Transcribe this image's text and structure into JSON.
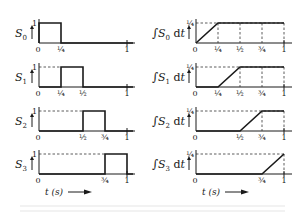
{
  "figure": {
    "left_column": {
      "panels": [
        {
          "label": "S",
          "sub": "0",
          "pulse": [
            0,
            0.25
          ],
          "y_top_label": "1",
          "ticks": [
            "0",
            "¼",
            "1"
          ],
          "tick_pos": [
            0,
            0.25,
            1
          ],
          "dashed": false
        },
        {
          "label": "S",
          "sub": "1",
          "pulse": [
            0.25,
            0.5
          ],
          "y_top_label": "1",
          "ticks": [
            "0",
            "¼",
            "½",
            "1"
          ],
          "tick_pos": [
            0,
            0.25,
            0.5,
            1
          ],
          "dashed": true
        },
        {
          "label": "S",
          "sub": "2",
          "pulse": [
            0.5,
            0.75
          ],
          "y_top_label": "1",
          "ticks": [
            "0",
            "½",
            "¾",
            "1"
          ],
          "tick_pos": [
            0,
            0.5,
            0.75,
            1
          ],
          "dashed": true
        },
        {
          "label": "S",
          "sub": "3",
          "pulse": [
            0.75,
            1.0
          ],
          "y_top_label": "1",
          "ticks": [
            "0",
            "¾",
            "1"
          ],
          "tick_pos": [
            0,
            0.75,
            1
          ],
          "dashed": true
        }
      ],
      "x_axis_label": "t (s)"
    },
    "right_column": {
      "panels": [
        {
          "label": "∫S",
          "sub": "0",
          "suffix": "dt",
          "ramp": [
            0,
            0.25
          ],
          "y_top_label": "¼",
          "ticks": [
            "0",
            "¼",
            "½",
            "¾",
            "1"
          ],
          "tick_pos": [
            0,
            0.25,
            0.5,
            0.75,
            1
          ],
          "vdash": [
            0.25,
            0.5,
            0.75,
            1
          ]
        },
        {
          "label": "∫S",
          "sub": "1",
          "suffix": "dt",
          "ramp": [
            0.25,
            0.5
          ],
          "y_top_label": "¼",
          "ticks": [
            "0",
            "¼",
            "½",
            "¾",
            "1"
          ],
          "tick_pos": [
            0,
            0.25,
            0.5,
            0.75,
            1
          ],
          "vdash": [
            0.5,
            0.75,
            1
          ]
        },
        {
          "label": "∫S",
          "sub": "2",
          "suffix": "dt",
          "ramp": [
            0.5,
            0.75
          ],
          "y_top_label": "¼",
          "ticks": [
            "0",
            "½",
            "¾",
            "1"
          ],
          "tick_pos": [
            0,
            0.5,
            0.75,
            1
          ],
          "vdash": [
            0.75,
            1
          ]
        },
        {
          "label": "∫S",
          "sub": "3",
          "suffix": "dt",
          "ramp": [
            0.75,
            1.0
          ],
          "y_top_label": "¼",
          "ticks": [
            "0",
            "¾",
            "1"
          ],
          "tick_pos": [
            0,
            0.75,
            1
          ],
          "vdash": [
            1
          ]
        }
      ],
      "x_axis_label": "t (s)"
    },
    "layout": {
      "baselines": [
        43,
        87,
        131,
        174
      ],
      "panel_height": 20,
      "left_x0": 39,
      "left_x1": 127,
      "right_x0": 196,
      "right_x1": 284,
      "axis_extend": 8,
      "xlabel_y": 195
    }
  }
}
